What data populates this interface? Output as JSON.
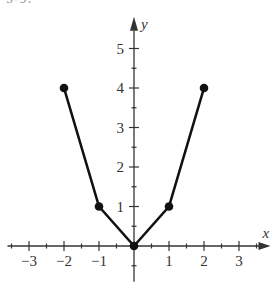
{
  "figure": {
    "partial_label": "5-9."
  },
  "chart_data": {
    "type": "line",
    "title": "",
    "xlabel": "x",
    "ylabel": "y",
    "xlim": [
      -3.5,
      3.5
    ],
    "ylim": [
      -0.7,
      5.6
    ],
    "x_ticks": [
      -3,
      -2,
      -1,
      1,
      2,
      3
    ],
    "x_tick_labels": [
      "−3",
      "−2",
      "−1",
      "1",
      "2",
      "3"
    ],
    "y_ticks": [
      1,
      2,
      3,
      4,
      5
    ],
    "y_tick_labels": [
      "1",
      "2",
      "3",
      "4",
      "5"
    ],
    "minor_tick_step": 0.5,
    "grid": false,
    "legend": null,
    "series": [
      {
        "name": "piecewise",
        "x": [
          -2,
          -1,
          0,
          1,
          2
        ],
        "y": [
          4,
          1,
          0,
          1,
          4
        ],
        "markers": "filled-circle",
        "color": "#111111"
      }
    ]
  },
  "style": {
    "axis_color": "#333333",
    "line_color": "#111111",
    "background": "#ffffff"
  }
}
